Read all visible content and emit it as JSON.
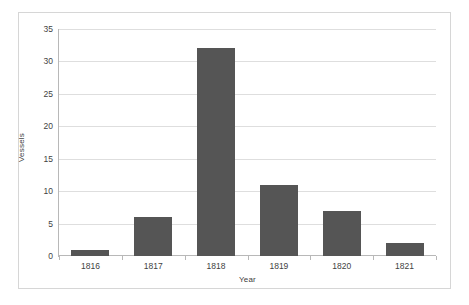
{
  "chart_data": {
    "type": "bar",
    "title": "",
    "subtitle": "",
    "xlabel": "Year",
    "ylabel": "Vessels",
    "categories": [
      "1816",
      "1817",
      "1818",
      "1819",
      "1820",
      "1821"
    ],
    "values": [
      1,
      6,
      32,
      11,
      7,
      2
    ],
    "series": [
      {
        "name": "Vessels",
        "values": [
          1,
          6,
          32,
          11,
          7,
          2
        ]
      }
    ],
    "ylim": [
      0,
      35
    ],
    "ytick_labels": [
      "0",
      "5",
      "10",
      "15",
      "20",
      "25",
      "30",
      "35"
    ],
    "ytick_values": [
      0,
      5,
      10,
      15,
      20,
      25,
      30,
      35
    ],
    "grid": true,
    "legend": false,
    "legend_position": "none",
    "bar_color": "#555555",
    "gridline_color": "#dedede",
    "axis_color": "#b8b8b8",
    "border_color": "#d6d6d6",
    "background_color": "#ffffff",
    "text_color": "#3f3f3f"
  }
}
